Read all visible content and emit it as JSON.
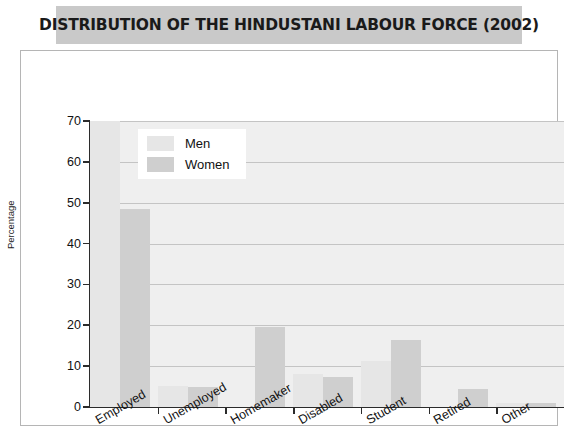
{
  "title": "DISTRIBUTION OF THE HINDUSTANI LABOUR FORCE (2002)",
  "legend": {
    "men_label": "Men",
    "women_label": "Women"
  },
  "axis": {
    "y_title": "Percentage",
    "y_ticks": [
      "0",
      "10",
      "20",
      "30",
      "40",
      "50",
      "60",
      "70"
    ]
  },
  "colors": {
    "men_bar": "#e6e6e6",
    "women_bar": "#cfcfcf",
    "plot_background": "#efefef",
    "title_background": "#c9c9c9",
    "axis": "#2b2b2b",
    "gridline": "#c4c4c4"
  },
  "chart_data": {
    "type": "bar",
    "title": "DISTRIBUTION OF THE HINDUSTANI LABOUR FORCE (2002)",
    "xlabel": "",
    "ylabel": "Percentage",
    "ylim": [
      0,
      70
    ],
    "ytick_step": 10,
    "grid": true,
    "legend_position": "upper-left-inside",
    "categories": [
      "Employed",
      "Unemployed",
      "Homemaker",
      "Disabled",
      "Student",
      "Retired",
      "Other"
    ],
    "series": [
      {
        "name": "Men",
        "values": [
          70.0,
          5.2,
          0.0,
          8.0,
          11.2,
          0.0,
          1.0
        ]
      },
      {
        "name": "Women",
        "values": [
          48.5,
          5.0,
          19.5,
          7.3,
          16.3,
          4.3,
          1.0
        ]
      }
    ]
  }
}
